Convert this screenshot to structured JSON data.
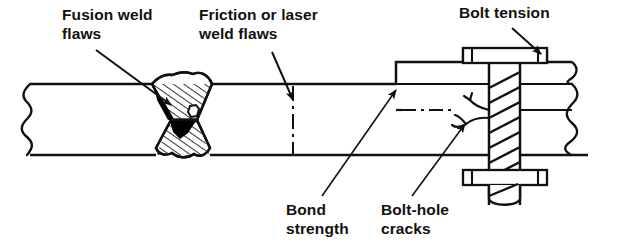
{
  "figure": {
    "background_color": "#ffffff",
    "line_color": "#111111",
    "fill_hatch_color": "#111111",
    "defect_fill_color": "#000000"
  },
  "labels": {
    "fusion_weld_flaws": "Fusion weld\nflaws",
    "friction_or_laser_weld_flaws": "Friction or laser\nweld flaws",
    "bolt_tension": "Bolt tension",
    "bond_strength": "Bond\nstrength",
    "bolt_hole_cracks": "Bolt-hole\ncracks"
  },
  "annotations": [
    {
      "name": "fusion-weld-flaws",
      "text": "Fusion weld\nflaws",
      "text_x": 62,
      "text_y": 8,
      "leader": {
        "x1": 96,
        "y1": 50,
        "x2": 171,
        "y2": 105
      },
      "arrow": true
    },
    {
      "name": "friction-or-laser-weld-flaws",
      "text": "Friction or laser\nweld flaws",
      "text_x": 200,
      "text_y": 8,
      "leader": {
        "x1": 272,
        "y1": 52,
        "x2": 293,
        "y2": 100
      },
      "arrow": true
    },
    {
      "name": "bolt-tension",
      "text": "Bolt tension",
      "text_x": 460,
      "text_y": 6,
      "leader": {
        "x1": 512,
        "y1": 28,
        "x2": 540,
        "y2": 53
      },
      "arrow": true
    },
    {
      "name": "bond-strength",
      "text": "Bond\nstrength",
      "text_x": 287,
      "text_y": 202,
      "leader": {
        "x1": 322,
        "y1": 196,
        "x2": 396,
        "y2": 92
      },
      "arrow": true
    },
    {
      "name": "bolt-hole-cracks",
      "text": "Bolt-hole\ncracks",
      "text_x": 383,
      "text_y": 202,
      "leader": {
        "x1": 412,
        "y1": 196,
        "x2": 466,
        "y2": 124
      },
      "arrow": true
    }
  ],
  "geometry": {
    "plate": {
      "top_y": 84,
      "bottom_y": 155,
      "left_break_x": 30,
      "right_break_x": 588
    },
    "fusion_weld": {
      "center_x": 181,
      "label": "X-groove double-V butt weld",
      "hatch_spacing": 6,
      "pore_x": 193,
      "pore_y": 112,
      "defect_notes": "black lack-of-fusion wedges on left bevel faces"
    },
    "friction_weld": {
      "center_x": 293,
      "line_style": "dash-dot",
      "top_y": 84,
      "bottom_y": 155
    },
    "bond_line": {
      "y": 110,
      "x_start": 402,
      "x_end": 452,
      "line_style": "dash-dot"
    },
    "lap_plate": {
      "left_x": 396,
      "top_y": 62,
      "right_x": 572
    },
    "bolt": {
      "shank_left": 489,
      "shank_right": 520,
      "top_nut": {
        "x": 463,
        "y": 48,
        "w": 84,
        "h": 15
      },
      "bottom_nut": {
        "x": 463,
        "y": 170,
        "w": 84,
        "h": 15
      },
      "thread_count": 7,
      "tip_y": 205
    },
    "bolt_hole_cracks": {
      "origin_x": 489,
      "origin_y": 118,
      "branch_count": 3
    }
  }
}
